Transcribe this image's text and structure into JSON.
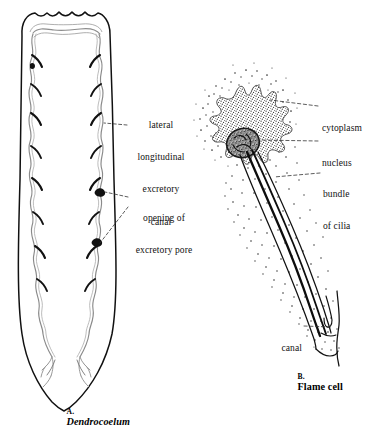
{
  "figure": {
    "background_color": "#ffffff",
    "ink_color": "#000000",
    "panels": [
      {
        "id": "panel-a",
        "prefix": "A.",
        "name": "Dendrocoelum",
        "name_style": "bold-italic",
        "subject": "planarian whole-body excretory system",
        "labels": [
          {
            "id": "lateral-longitudinal-excretory-canal",
            "lines": [
              "lateral",
              "longitudinal",
              "excretory",
              "canal"
            ],
            "text": "lateral longitudinal excretory canal",
            "align": "center"
          },
          {
            "id": "opening-of-excretory-pore",
            "lines": [
              "opening of",
              "excretory pore"
            ],
            "text": "opening of excretory pore",
            "align": "center"
          }
        ]
      },
      {
        "id": "panel-b",
        "prefix": "B.",
        "name": "Flame cell",
        "name_style": "bold-roman",
        "subject": "single flame cell (protonephridium)",
        "labels": [
          {
            "id": "cytoplasm",
            "lines": [
              "cytoplasm"
            ],
            "text": "cytoplasm",
            "align": "left"
          },
          {
            "id": "nucleus",
            "lines": [
              "nucleus"
            ],
            "text": "nucleus",
            "align": "left"
          },
          {
            "id": "bundle-of-cilia",
            "lines": [
              "bundle",
              "of cilia"
            ],
            "text": "bundle of cilia",
            "align": "left"
          },
          {
            "id": "canal",
            "lines": [
              "canal"
            ],
            "text": "canal",
            "align": "right"
          }
        ]
      }
    ],
    "captions": {
      "a_prefix": "A.",
      "a_name": "Dendrocoelum",
      "b_prefix": "B.",
      "b_name": "Flame cell"
    },
    "label_text": {
      "lateral": "lateral",
      "longitudinal": "longitudinal",
      "excretory": "excretory",
      "canal_word": "canal",
      "opening_of": "opening of",
      "excretory_pore": "excretory pore",
      "cytoplasm": "cytoplasm",
      "nucleus": "nucleus",
      "bundle": "bundle",
      "of_cilia": "of cilia",
      "canal": "canal"
    }
  }
}
